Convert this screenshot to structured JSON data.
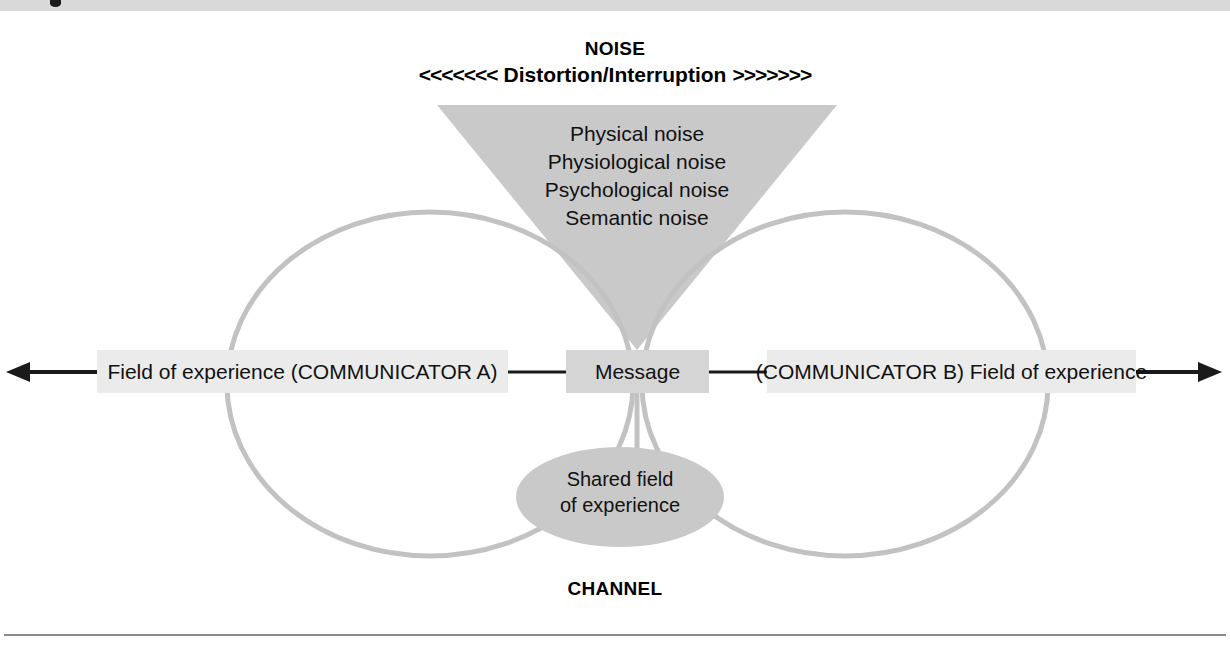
{
  "figure": {
    "noise_heading": "NOISE",
    "noise_arrows_left": "<<<<<<<",
    "noise_subtitle": "Distortion/Interruption",
    "noise_arrows_right": ">>>>>>>",
    "channel_label": "CHANNEL"
  },
  "noise_types": [
    "Physical noise",
    "Physiological noise",
    "Psychological noise",
    "Semantic noise"
  ],
  "boxes": {
    "left": "Field of experience (COMMUNICATOR A)",
    "message": "Message",
    "right": "(COMMUNICATOR B) Field of experience"
  },
  "shared": {
    "line1": "Shared field",
    "line2": "of experience"
  },
  "colors": {
    "noise_triangle": "#c9c9c9",
    "loop_stroke": "#c2c2c2",
    "field_box": "#ebebeb",
    "message_box": "#d5d5d5",
    "shared_ellipse": "#c9c9c9",
    "arrow": "#1a1a1a",
    "text": "#111111",
    "rule": "#8a8a8a"
  }
}
